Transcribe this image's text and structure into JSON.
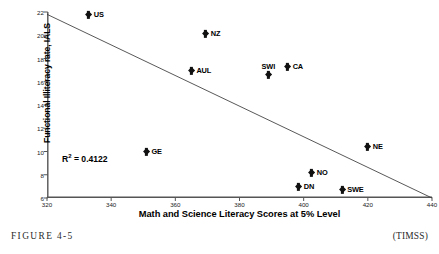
{
  "figure": {
    "caption": "FIGURE 4-5",
    "source": "(TIMSS)"
  },
  "annotation": {
    "r_squared_prefix": "R",
    "r_squared_exponent": "2",
    "r_squared_value": " = 0.4122",
    "r_squared_full": "R2 = 0.4122"
  },
  "colors": {
    "marker": "#111111",
    "axis": "#555555",
    "trendline": "#3a3a3a",
    "text": "#000000",
    "background": "#ffffff"
  },
  "chart_data": {
    "type": "scatter",
    "title": "",
    "xlabel": "Math and Science Literacy Scores at 5% Level",
    "ylabel": "Functional Illiteracy rate, IALS",
    "xlim": [
      320,
      440
    ],
    "ylim": [
      6,
      22
    ],
    "xticks": [
      320,
      340,
      360,
      380,
      400,
      420,
      440
    ],
    "yticks": [
      6,
      8,
      10,
      12,
      14,
      16,
      18,
      20,
      22
    ],
    "grid": false,
    "legend": null,
    "points": [
      {
        "label": "US",
        "x": 333.0,
        "y": 21.8,
        "label_pos": "right"
      },
      {
        "label": "NZ",
        "x": 369.5,
        "y": 20.1,
        "label_pos": "right"
      },
      {
        "label": "AUL",
        "x": 365.0,
        "y": 17.0,
        "label_pos": "right"
      },
      {
        "label": "CA",
        "x": 395.0,
        "y": 17.3,
        "label_pos": "right"
      },
      {
        "label": "SWI",
        "x": 389.0,
        "y": 16.6,
        "label_pos": "above"
      },
      {
        "label": "GE",
        "x": 351.0,
        "y": 10.0,
        "label_pos": "right"
      },
      {
        "label": "NE",
        "x": 420.0,
        "y": 10.4,
        "label_pos": "right"
      },
      {
        "label": "NO",
        "x": 402.5,
        "y": 8.2,
        "label_pos": "right"
      },
      {
        "label": "DN",
        "x": 398.5,
        "y": 7.0,
        "label_pos": "right"
      },
      {
        "label": "SWE",
        "x": 412.0,
        "y": 6.7,
        "label_pos": "right"
      }
    ],
    "trendline": {
      "x_start": 320,
      "y_start": 21.8,
      "x_end": 440,
      "y_end": 6.0,
      "r_squared": 0.4122
    }
  }
}
